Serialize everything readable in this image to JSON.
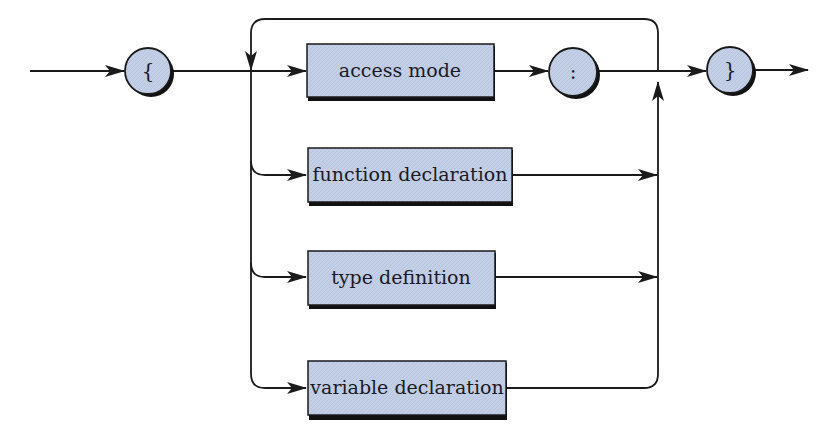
{
  "diagram": {
    "type": "syntax-diagram",
    "colors": {
      "fill": "#c3cfe6",
      "stroke": "#1a1a1a",
      "shadow": "#111111",
      "background": "#ffffff"
    },
    "start_terminal": {
      "label": "{"
    },
    "end_terminal": {
      "label": "}"
    },
    "branches": [
      {
        "label": "access mode"
      },
      {
        "label": "function declaration"
      },
      {
        "label": "type definition"
      },
      {
        "label": "variable declaration"
      }
    ],
    "separator_terminal": {
      "label": ":"
    }
  }
}
